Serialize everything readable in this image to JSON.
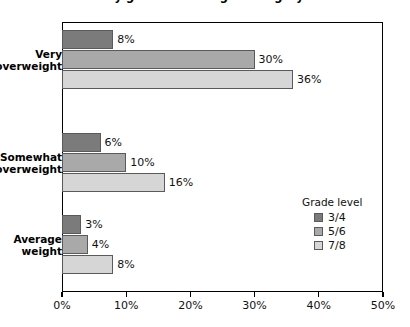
{
  "chart_data": {
    "type": "bar",
    "orientation": "horizontal",
    "title": "by grade and weight category",
    "xlabel": "",
    "ylabel": "",
    "xlim": [
      0,
      50
    ],
    "xticks": [
      "0%",
      "10%",
      "20%",
      "30%",
      "40%",
      "50%"
    ],
    "xtick_values": [
      0,
      10,
      20,
      30,
      40,
      50
    ],
    "grid": false,
    "categories": [
      "Very overweight",
      "Somewhat overweight",
      "Average weight"
    ],
    "category_lines": [
      [
        "Very",
        "overweight"
      ],
      [
        "Somewhat",
        "overweight"
      ],
      [
        "Average",
        "weight"
      ]
    ],
    "legend": {
      "title": "Grade level",
      "position": "inside-right",
      "entries": [
        "3/4",
        "5/6",
        "7/8"
      ]
    },
    "series": [
      {
        "name": "3/4",
        "color": "#7b7b7b",
        "values": [
          8,
          6,
          3
        ],
        "labels": [
          "8%",
          "6%",
          "3%"
        ]
      },
      {
        "name": "5/6",
        "color": "#a9a9a9",
        "values": [
          30,
          10,
          4
        ],
        "labels": [
          "30%",
          "10%",
          "4%"
        ]
      },
      {
        "name": "7/8",
        "color": "#d6d6d6",
        "values": [
          36,
          16,
          8
        ],
        "labels": [
          "36%",
          "16%",
          "8%"
        ]
      }
    ]
  }
}
